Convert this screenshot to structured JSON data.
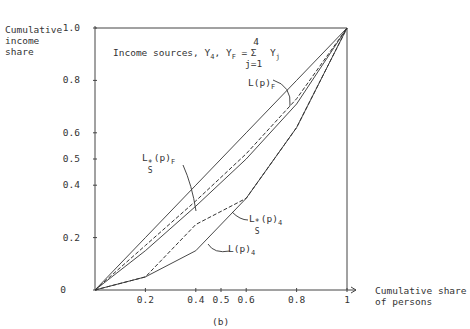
{
  "chart_data": {
    "type": "line",
    "caption": "(b)",
    "xlabel": "Cumulative share of persons",
    "ylabel": "Cumulative income share",
    "xlim": [
      0,
      1
    ],
    "ylim": [
      0,
      1.0
    ],
    "x_ticks": [
      "0.2",
      "0.4",
      "0.5",
      "0.6",
      "0.8",
      "1"
    ],
    "y_ticks": [
      "0",
      "0.2",
      "0.4",
      "0.5",
      "0.6",
      "0.8",
      "1.0"
    ],
    "grid": false,
    "x": [
      0,
      0.2,
      0.4,
      0.6,
      0.8,
      1
    ],
    "series": [
      {
        "name": "Equality line",
        "style": "solid",
        "values": [
          0,
          0.2,
          0.4,
          0.6,
          0.8,
          1
        ]
      },
      {
        "name": "L(p)F",
        "style": "solid",
        "values": [
          0,
          0.15,
          0.32,
          0.5,
          0.71,
          1
        ]
      },
      {
        "name": "L*S(p)F",
        "style": "dashed",
        "values": [
          0,
          0.17,
          0.34,
          0.52,
          0.73,
          1
        ]
      },
      {
        "name": "L*S(p)4",
        "style": "dashed",
        "values": [
          0,
          0.05,
          0.25,
          0.35,
          0.62,
          1
        ]
      },
      {
        "name": "L(p)4",
        "style": "solid",
        "values": [
          0,
          0.05,
          0.15,
          0.35,
          0.62,
          1
        ]
      }
    ]
  },
  "labels": {
    "ylabel_lines": [
      "Cumulative",
      "income",
      "share"
    ],
    "xlabel_lines": [
      "Cumulative share",
      "of persons"
    ],
    "title_text": "Income sources, Y",
    "title_sub4": "4",
    "title_mid": ", Y",
    "title_subF": "F",
    "title_eq": " = ",
    "sum_top": "4",
    "sum_sym": "Σ",
    "sum_bot": "j=1",
    "sum_term": "Y",
    "sum_term_sub": "j",
    "caption": "(b)",
    "lpF": "L(p)",
    "lpF_sub": "F",
    "lsF": "L",
    "lsF_sup": "*",
    "lsF_sub": "S",
    "lsF_rest": "(p)",
    "lsF_sub2": "F",
    "ls4": "L",
    "ls4_sup": "*",
    "ls4_sub": "S",
    "ls4_rest": "(p)",
    "ls4_sub2": "4",
    "lp4": "L(p)",
    "lp4_sub": "4"
  }
}
